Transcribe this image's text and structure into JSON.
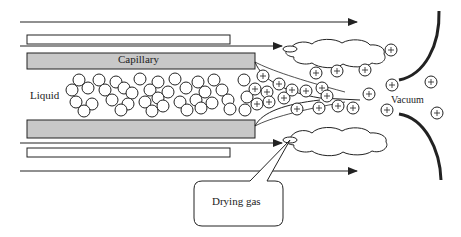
{
  "figure": {
    "labels": {
      "capillary": "Capillary",
      "liquid": "Liquid",
      "vacuum": "Vacuum",
      "drying_gas": "Drying gas"
    },
    "ion_symbol": "+",
    "colors": {
      "capillary_fill": "#c8c8c8",
      "stroke": "#222222",
      "background": "#ffffff"
    }
  }
}
